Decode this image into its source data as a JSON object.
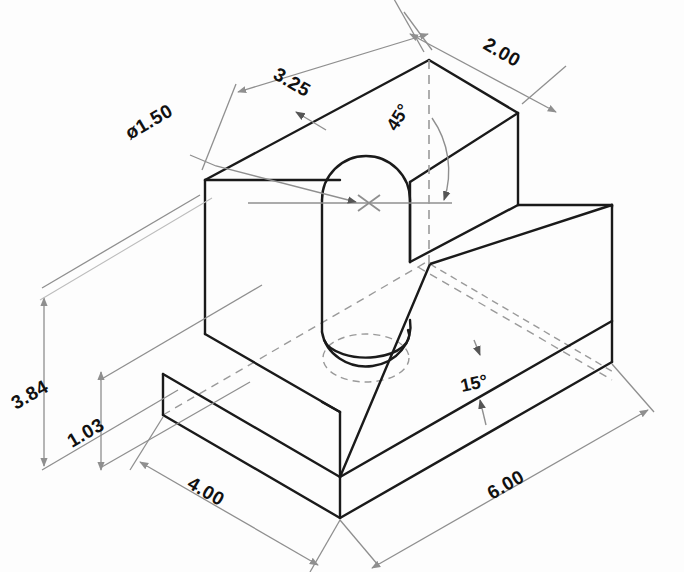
{
  "drawing": {
    "title": "Isometric Technical Drawing",
    "type": "isometric-mechanical-part",
    "background_color": "#fdfdfd",
    "object_line_color": "#1a1a1a",
    "dimension_line_color": "#8f8f8f",
    "hidden_line_color": "#9a9a9a",
    "center_line_color": "#8f8f8f",
    "text_color": "#111111"
  },
  "dimensions": [
    {
      "id": "diameter-hole",
      "label": "ø1.50",
      "value": 1.5,
      "unit": "in",
      "kind": "diameter",
      "rotation": -30
    },
    {
      "id": "top-length",
      "label": "3.25",
      "value": 3.25,
      "unit": "in",
      "kind": "linear",
      "rotation": 30
    },
    {
      "id": "top-width",
      "label": "2.00",
      "value": 2.0,
      "unit": "in",
      "kind": "linear",
      "rotation": 30
    },
    {
      "id": "overall-height",
      "label": "3.84",
      "value": 3.84,
      "unit": "in",
      "kind": "linear",
      "rotation": -30
    },
    {
      "id": "base-height",
      "label": "1.03",
      "value": 1.03,
      "unit": "in",
      "kind": "linear",
      "rotation": -30
    },
    {
      "id": "base-width",
      "label": "4.00",
      "value": 4.0,
      "unit": "in",
      "kind": "linear",
      "rotation": 30
    },
    {
      "id": "base-length",
      "label": "6.00",
      "value": 6.0,
      "unit": "in",
      "kind": "linear",
      "rotation": -30
    },
    {
      "id": "angle-chamfer",
      "label": "45°",
      "value": 45,
      "unit": "deg",
      "kind": "angular",
      "rotation": -60
    },
    {
      "id": "angle-ramp",
      "label": "15°",
      "value": 15,
      "unit": "deg",
      "kind": "angular",
      "rotation": 0
    }
  ],
  "features": [
    {
      "id": "cylindrical-boss",
      "name": "Cylindrical boss with ø1.50 hole"
    },
    {
      "id": "upper-block",
      "name": "Raised rectangular block"
    },
    {
      "id": "ramp-face",
      "name": "15° inclined ramp face"
    },
    {
      "id": "base-plate",
      "name": "Rectangular base plate"
    },
    {
      "id": "center-mark",
      "name": "Hole center mark"
    }
  ]
}
